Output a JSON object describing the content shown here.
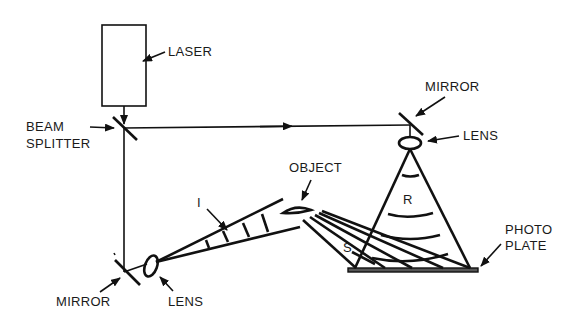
{
  "diagram": {
    "type": "holography-setup",
    "labels": {
      "laser": "LASER",
      "beam_splitter_1": "BEAM",
      "beam_splitter_2": "SPLITTER",
      "mirror_top": "MIRROR",
      "lens_top": "LENS",
      "object": "OBJECT",
      "illumination": "I",
      "reference": "R",
      "scattered": "S",
      "photo_plate_1": "PHOTO",
      "photo_plate_2": "PLATE",
      "mirror_bottom": "MIRROR",
      "lens_bottom": "LENS"
    },
    "colors": {
      "ink": "#111111",
      "background": "#ffffff"
    }
  }
}
